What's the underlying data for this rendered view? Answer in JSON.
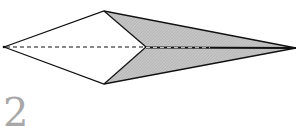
{
  "figure": {
    "type": "origami-fold-diagram",
    "step_number": "2",
    "colors": {
      "background": "#ffffff",
      "outline": "#111111",
      "shaded_face": "#bdbdbd",
      "step_number": "#a8a8a8"
    },
    "points": {
      "left_tip": [
        4,
        47
      ],
      "top_vertex": [
        104,
        11
      ],
      "bottom_vertex": [
        104,
        84
      ],
      "center_join": [
        146,
        47
      ],
      "right_tip": [
        296,
        48
      ]
    },
    "lines": {
      "valley_fold": "dashed",
      "outline": "solid"
    }
  }
}
